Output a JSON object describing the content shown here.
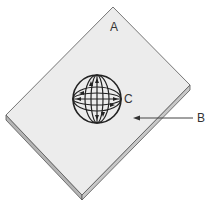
{
  "labels": {
    "a": "A",
    "b": "B",
    "c": "C"
  },
  "colors": {
    "plate_top": "#ececec",
    "plate_edge": "#bdbdbd",
    "line": "#222222"
  }
}
